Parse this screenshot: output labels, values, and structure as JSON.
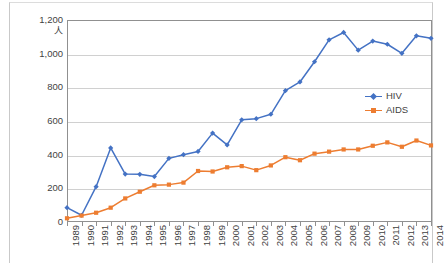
{
  "chart_data": {
    "type": "line",
    "title": "",
    "subtitle": "",
    "xlabel": "",
    "ylabel": "人",
    "unit_label": "人",
    "ylim": [
      0,
      1200
    ],
    "ytick_step": 200,
    "ytick_labels": [
      "1,200",
      "1,000",
      "800",
      "600",
      "400",
      "200",
      "0"
    ],
    "ytick_values": [
      1200,
      1000,
      800,
      600,
      400,
      200,
      0
    ],
    "grid": true,
    "grid_axis": "y",
    "legend_position": "right-inside",
    "categories": [
      "1989",
      "1990",
      "1991",
      "1992",
      "1993",
      "1994",
      "1995",
      "1996",
      "1997",
      "1998",
      "1999",
      "2000",
      "2001",
      "2002",
      "2003",
      "2004",
      "2005",
      "2006",
      "2007",
      "2008",
      "2009",
      "2010",
      "2011",
      "2012",
      "2013",
      "2014"
    ],
    "series": [
      {
        "name": "HIV",
        "color": "#4472C4",
        "marker": "diamond",
        "values": [
          85,
          40,
          210,
          440,
          285,
          283,
          270,
          378,
          400,
          419,
          528,
          458,
          607,
          614,
          640,
          780,
          832,
          952,
          1082,
          1126,
          1021,
          1075,
          1056,
          1002,
          1106,
          1091
        ]
      },
      {
        "name": "AIDS",
        "color": "#ED7D31",
        "marker": "square",
        "values": [
          22,
          38,
          55,
          85,
          140,
          180,
          218,
          222,
          234,
          303,
          300,
          325,
          332,
          308,
          336,
          385,
          367,
          406,
          418,
          431,
          431,
          453,
          473,
          447,
          484,
          455
        ]
      }
    ]
  },
  "legend": {
    "items": [
      {
        "label": "HIV",
        "color": "#4472C4"
      },
      {
        "label": "AIDS",
        "color": "#ED7D31"
      }
    ]
  }
}
